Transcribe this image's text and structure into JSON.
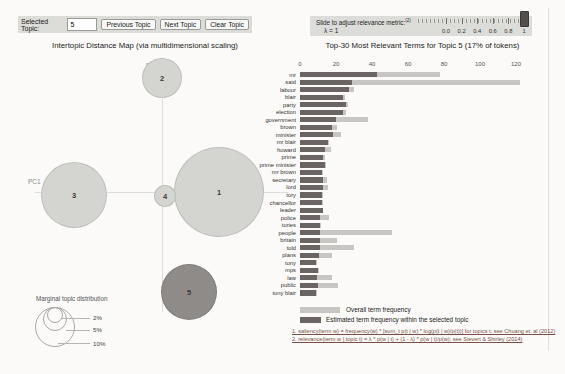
{
  "controls": {
    "selected_topic_label": "Selected Topic:",
    "selected_topic_value": "5",
    "prev_button": "Previous Topic",
    "next_button": "Next Topic",
    "clear_button": "Clear Topic"
  },
  "slider": {
    "label": "Slide to adjust relevance metric:",
    "sup": "(2)",
    "lambda": "λ = 1",
    "ticks": [
      "0.0",
      "0.2",
      "0.4",
      "0.6",
      "0.8",
      "1"
    ],
    "value": "1"
  },
  "map": {
    "title": "Intertopic Distance Map (via multidimensional scaling)",
    "x_label": "PC1",
    "y_label": "PC2",
    "topics": [
      {
        "label": "1",
        "cx": 219,
        "cy": 192,
        "r": 45,
        "selected": false
      },
      {
        "label": "2",
        "cx": 162,
        "cy": 78,
        "r": 20,
        "selected": false
      },
      {
        "label": "3",
        "cx": 74,
        "cy": 195,
        "r": 33,
        "selected": false
      },
      {
        "label": "4",
        "cx": 165,
        "cy": 196,
        "r": 11,
        "selected": false
      },
      {
        "label": "5",
        "cx": 189,
        "cy": 292,
        "r": 28,
        "selected": true
      }
    ],
    "legend_title": "Marginal topic distribution",
    "legend_sizes": [
      "2%",
      "5%",
      "10%"
    ]
  },
  "chart_data": {
    "type": "bar",
    "orientation": "horizontal",
    "title": "Top-30 Most Relevant Terms for Topic 5 (17% of tokens)",
    "x_ticks": [
      0,
      20,
      40,
      60,
      80,
      100,
      120
    ],
    "xlim": [
      0,
      128
    ],
    "categories": [
      "mr",
      "said",
      "labour",
      "blair",
      "party",
      "election",
      "government",
      "brown",
      "minister",
      "mr blair",
      "howard",
      "prime",
      "prime minister",
      "mr brown",
      "secretary",
      "lord",
      "tory",
      "chancellor",
      "leader",
      "police",
      "tories",
      "people",
      "britain",
      "told",
      "plans",
      "tony",
      "mps",
      "law",
      "public",
      "tony blair"
    ],
    "series": [
      {
        "name": "Overall term frequency",
        "values": [
          78,
          122,
          30,
          25,
          26.5,
          25.5,
          38,
          20.5,
          22.5,
          16,
          17,
          14,
          14.5,
          12.5,
          15,
          15.5,
          12.5,
          12.5,
          13,
          16,
          11.5,
          51,
          20.5,
          30,
          18,
          9.5,
          10.5,
          17.5,
          21,
          9.5
        ]
      },
      {
        "name": "Estimated term frequency within the selected topic",
        "values": [
          43,
          29,
          27,
          24,
          25.5,
          24,
          20,
          17.5,
          18.5,
          15.5,
          14,
          13,
          14,
          12,
          13,
          13,
          12,
          12,
          12.5,
          11,
          11,
          11,
          11,
          11,
          10.5,
          9,
          10,
          9.5,
          10,
          9
        ]
      }
    ]
  },
  "footnotes": [
    "1. saliency(term w) = frequency(w) * [sum_t p(t | w) * log(p(t | w)/p(t))] for topics t; see Chuang et. al (2012)",
    "2. relevance(term w | topic t) = λ * p(w | t) + (1 - λ) * p(w | t)/p(w); see Sievert & Shirley (2014)"
  ],
  "colors": {
    "bar_overall": "#c7c6c2",
    "bar_topic": "#6a6462",
    "circle_fill": "#d4d4d0",
    "circle_selected_fill": "#8f8b88",
    "slider_handle": "#55504d",
    "footnote_text": "#7a4f45",
    "control_bg": "#dcdcd9"
  }
}
